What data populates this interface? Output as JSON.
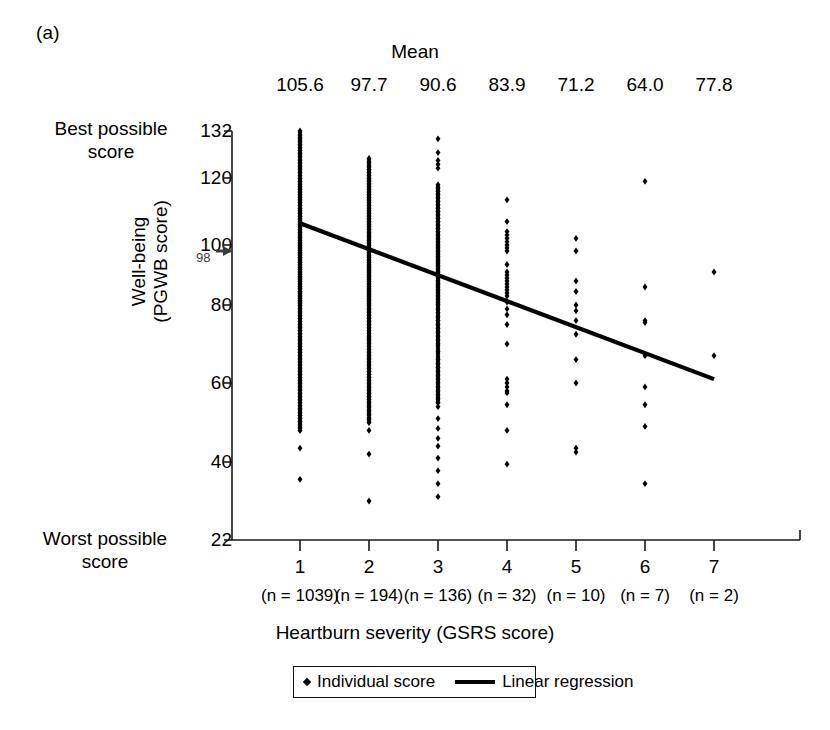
{
  "panel": {
    "label": "(a)"
  },
  "mean_header": {
    "title": "Mean"
  },
  "axes": {
    "y_title_line1": "Well-being",
    "y_title_line2": "(PGWB score)",
    "x_title": "Heartburn severity (GSRS score)",
    "best_label_line1": "Best possible",
    "best_label_line2": "score",
    "worst_label_line1": "Worst possible",
    "worst_label_line2": "score",
    "annotation_98": "98"
  },
  "legend": {
    "point_label": "Individual score",
    "line_label": "Linear regression",
    "point_icon": "diamond-marker-icon",
    "line_icon": "line-segment-icon"
  },
  "colors": {
    "ink": "#000000",
    "axis": "#1a1a1a",
    "background": "#ffffff",
    "annotation": "#3b3b3b"
  },
  "chart_data": {
    "type": "scatter",
    "title": "",
    "xlabel": "Heartburn severity (GSRS score)",
    "ylabel": "Well-being (PGWB score)",
    "xlim": [
      0.5,
      7.5
    ],
    "ylim": [
      22,
      132
    ],
    "grid": false,
    "legend_position": "bottom-center",
    "yticks": [
      22,
      40,
      60,
      80,
      100,
      120,
      132
    ],
    "ytick_labels": [
      "22",
      "40",
      "60",
      "80",
      "100",
      "120",
      "132"
    ],
    "xticks": [
      1,
      2,
      3,
      4,
      5,
      6,
      7
    ],
    "xtick_labels": [
      "1",
      "2",
      "3",
      "4",
      "5",
      "6",
      "7"
    ],
    "categories": [
      "1",
      "2",
      "3",
      "4",
      "5",
      "6",
      "7"
    ],
    "group_means": [
      105.6,
      97.7,
      90.6,
      83.9,
      71.2,
      64.0,
      77.8
    ],
    "group_mean_labels": [
      "105.6",
      "97.7",
      "90.6",
      "83.9",
      "71.2",
      "64.0",
      "77.8"
    ],
    "group_counts": [
      1039,
      194,
      136,
      32,
      10,
      7,
      2
    ],
    "group_count_labels": [
      "(n = 1039)",
      "(n = 194)",
      "(n = 136)",
      "(n = 32)",
      "(n = 10)",
      "(n = 7)",
      "(n = 2)"
    ],
    "reference_value": 98,
    "regression": {
      "name": "Linear regression",
      "x_start": 1,
      "y_start": 106.5,
      "x_end": 7,
      "y_end": 61.0
    },
    "series": [
      {
        "name": "Individual score",
        "marker": "diamond",
        "groups": [
          {
            "x": 1,
            "n": 1039,
            "y_min": 36,
            "y_max": 132,
            "dense_band": [
              48,
              132
            ],
            "outliers": [
              43.5,
              36
            ],
            "values": [
              132,
              131,
              130.2,
              129.4,
              128.6,
              127.8,
              127,
              126.2,
              125.4,
              124.6,
              123.8,
              123,
              122.2,
              121.4,
              120.6,
              119.8,
              119,
              118.2,
              117.4,
              116.6,
              115.8,
              115,
              114.2,
              113.4,
              112.6,
              111.8,
              111,
              110.2,
              109.4,
              108.6,
              107.8,
              107,
              106.2,
              105.4,
              104.6,
              103.8,
              103,
              102.2,
              101.4,
              100.6,
              99.8,
              99,
              98.2,
              97.4,
              96.6,
              95.8,
              95,
              94.2,
              93.4,
              92.6,
              91.8,
              91,
              90.2,
              89.4,
              88.6,
              87.8,
              87,
              86.2,
              85.4,
              84.6,
              83.8,
              83,
              82.2,
              81.4,
              80.6,
              79.8,
              79,
              78.2,
              77.4,
              76.6,
              75.8,
              75,
              74.2,
              73.4,
              72.6,
              71.8,
              71,
              70.2,
              69.4,
              68.6,
              67.8,
              67,
              66.2,
              65.4,
              64.6,
              63.8,
              63,
              62.2,
              61.4,
              60.6,
              59.8,
              59,
              58.2,
              57.4,
              56.6,
              55.8,
              55,
              54.2,
              53.4,
              52.6,
              51.8,
              51,
              50.2,
              49.4,
              48.6,
              48,
              43.5,
              36
            ]
          },
          {
            "x": 2,
            "n": 194,
            "y_min": 31,
            "y_max": 125,
            "dense_band": [
              50,
              125
            ],
            "outliers": [
              48,
              42,
              31
            ],
            "values": [
              125,
              124,
              123,
              122.2,
              121.4,
              120.6,
              119.8,
              119,
              118.2,
              117.4,
              116.6,
              115.8,
              115,
              114.2,
              113.4,
              112.6,
              111.8,
              111,
              110.2,
              109.4,
              108.6,
              107.8,
              107,
              106.2,
              105.4,
              104.6,
              103.8,
              103,
              102.2,
              101.4,
              100.6,
              99.8,
              99,
              98.2,
              97.4,
              96.6,
              95.8,
              95,
              94.2,
              93.4,
              92.6,
              91.8,
              91,
              90.2,
              89.4,
              88.6,
              87.8,
              87,
              86.2,
              85.4,
              84.6,
              83.8,
              83,
              82.2,
              81.4,
              80.6,
              79.8,
              79,
              78.2,
              77.4,
              76.6,
              75.8,
              75,
              74.2,
              73.4,
              72.6,
              71.8,
              71,
              70.2,
              69.4,
              68.6,
              67.8,
              67,
              66.2,
              65.4,
              64.6,
              63.8,
              63,
              62.2,
              61.4,
              60.6,
              59.8,
              59,
              58.2,
              57.4,
              56.6,
              55.8,
              55,
              54,
              53,
              52,
              51,
              50,
              48,
              42,
              31
            ]
          },
          {
            "x": 3,
            "n": 136,
            "y_min": 32,
            "y_max": 130,
            "dense_band": [
              55,
              118
            ],
            "outliers": [
              130,
              126.5,
              124.5,
              123,
              54,
              51,
              48.5,
              46,
              44,
              41,
              38,
              35,
              32
            ],
            "values": [
              130,
              126.5,
              124.5,
              123.5,
              122.5,
              118,
              117,
              116,
              115,
              114,
              113,
              112,
              111,
              110,
              109,
              108,
              107,
              106,
              105,
              104,
              103,
              102,
              101,
              100,
              99,
              98,
              97,
              96,
              95,
              94,
              93,
              92,
              91,
              90,
              89,
              88,
              87,
              86,
              85,
              84,
              83,
              82,
              81,
              80,
              79,
              78,
              77,
              76,
              75,
              74,
              73,
              72,
              71,
              70,
              68,
              66,
              65,
              64,
              63,
              62,
              61,
              60,
              59,
              58,
              57,
              56,
              55,
              54,
              51,
              48.5,
              46,
              44,
              41,
              38,
              35,
              32
            ]
          },
          {
            "x": 4,
            "n": 32,
            "y_min": 39.5,
            "y_max": 113.5,
            "values": [
              113.5,
              107,
              104,
              103,
              102,
              101,
              100,
              99,
              98,
              93.5,
              91,
              90,
              89,
              88,
              87,
              86,
              85,
              84,
              83,
              81,
              79,
              77.5,
              75,
              70,
              61,
              60,
              59,
              58,
              57.5,
              54.5,
              48,
              39.5
            ]
          },
          {
            "x": 5,
            "n": 10,
            "y_min": 42.5,
            "y_max": 102,
            "values": [
              102,
              98,
              88,
              84.5,
              80,
              78.5,
              76,
              72.5,
              66,
              60,
              43.5,
              42.5
            ]
          },
          {
            "x": 6,
            "n": 7,
            "y_min": 35,
            "y_max": 119,
            "values": [
              119,
              86,
              76,
              75.5,
              67,
              59,
              54.5,
              49,
              35
            ]
          },
          {
            "x": 7,
            "n": 2,
            "y_min": 67,
            "y_max": 91,
            "values": [
              91,
              67
            ]
          }
        ]
      }
    ]
  }
}
